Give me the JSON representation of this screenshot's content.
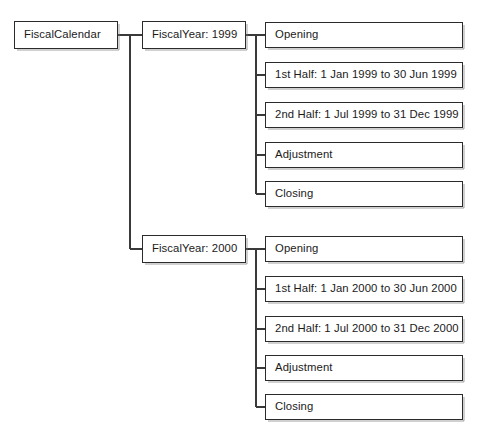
{
  "diagram": {
    "type": "tree",
    "orientation": "left-to-right",
    "root": {
      "label": "FiscalCalendar"
    },
    "line_color": "#3a3a3a",
    "box_border_color": "#2b2b2b",
    "background_color": "#ffffff",
    "branches": [
      {
        "label": "FiscalYear: 1999",
        "children": [
          {
            "label": "Opening"
          },
          {
            "label": "1st Half: 1 Jan 1999 to 30 Jun 1999"
          },
          {
            "label": "2nd Half: 1 Jul 1999 to 31 Dec 1999"
          },
          {
            "label": "Adjustment"
          },
          {
            "label": "Closing"
          }
        ]
      },
      {
        "label": "FiscalYear: 2000",
        "children": [
          {
            "label": "Opening"
          },
          {
            "label": "1st Half: 1 Jan 2000 to 30 Jun 2000"
          },
          {
            "label": "2nd Half: 1 Jul 2000 to 31 Dec 2000"
          },
          {
            "label": "Adjustment"
          },
          {
            "label": "Closing"
          }
        ]
      }
    ],
    "caption": ""
  },
  "geometry": {
    "root": {
      "x": 14,
      "y": 21,
      "w": 104,
      "h": 28
    },
    "year_col": {
      "x": 142,
      "w": 104,
      "h": 28
    },
    "leaf_col": {
      "x": 265,
      "w": 198,
      "h": 26
    },
    "branch_y": [
      35,
      249
    ],
    "trunk_x": 130,
    "leaf_rows_1": [
      22,
      62,
      102,
      142,
      181
    ],
    "leaf_rows_2": [
      236,
      276,
      316,
      355,
      394
    ]
  }
}
